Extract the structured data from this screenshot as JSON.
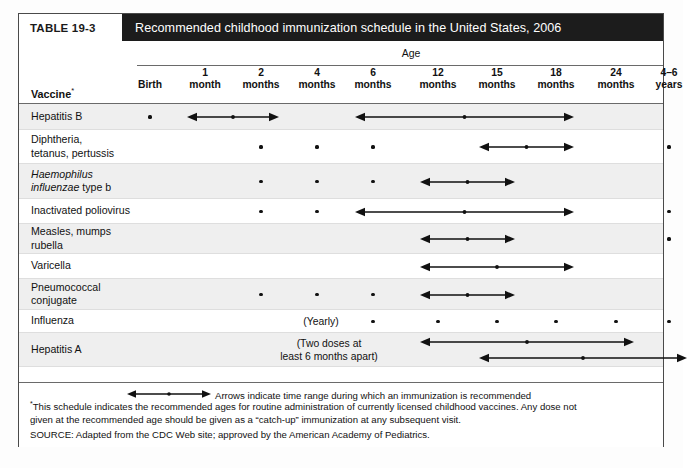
{
  "table": {
    "number": "TABLE 19-3",
    "title": "Recommended childhood immunization schedule in the United States, 2006",
    "group_header": "Age",
    "row_header": "Vaccine",
    "row_header_marker": "*"
  },
  "columns": [
    {
      "top": "",
      "bottom": "Birth",
      "x": 131
    },
    {
      "top": "1",
      "bottom": "month",
      "x": 186
    },
    {
      "top": "2",
      "bottom": "months",
      "x": 242
    },
    {
      "top": "4",
      "bottom": "months",
      "x": 298
    },
    {
      "top": "6",
      "bottom": "months",
      "x": 354
    },
    {
      "top": "12",
      "bottom": "months",
      "x": 419
    },
    {
      "top": "15",
      "bottom": "months",
      "x": 478
    },
    {
      "top": "18",
      "bottom": "months",
      "x": 537
    },
    {
      "top": "24",
      "bottom": "months",
      "x": 597
    },
    {
      "top": "4–6",
      "bottom": "years",
      "x": 650
    }
  ],
  "rows": [
    {
      "label": "Hepatitis B",
      "label_lines": [
        "Hepatitis B"
      ],
      "italic_lines": []
    },
    {
      "label": "Diphtheria, tetanus, pertussis",
      "label_lines": [
        "Diphtheria,",
        "tetanus, pertussis"
      ],
      "italic_lines": []
    },
    {
      "label": "Haemophilus influenzae type b",
      "label_lines": [
        "Haemophilus",
        "influenzae type b"
      ],
      "italic_lines": [
        0
      ]
    },
    {
      "label": "Inactivated poliovirus",
      "label_lines": [
        "Inactivated poliovirus"
      ],
      "italic_lines": []
    },
    {
      "label": "Measles, mumps rubella",
      "label_lines": [
        "Measles, mumps",
        "rubella"
      ],
      "italic_lines": []
    },
    {
      "label": "Varicella",
      "label_lines": [
        "Varicella"
      ],
      "italic_lines": []
    },
    {
      "label": "Pneumococcal conjugate",
      "label_lines": [
        "Pneumococcal",
        "conjugate"
      ],
      "italic_lines": []
    },
    {
      "label": "Influenza",
      "label_lines": [
        "Influenza"
      ],
      "italic_lines": [],
      "note": "(Yearly)"
    },
    {
      "label": "Hepatitis A",
      "label_lines": [
        "Hepatitis A"
      ],
      "italic_lines": [],
      "note": "(Two doses at\nleast 6 months apart)"
    }
  ],
  "schedule": {
    "Hepatitis B": {
      "dots": [
        "Birth"
      ],
      "ranges": [
        {
          "from": "1 month",
          "to": "2 months",
          "mid": true
        },
        {
          "from": "6 months",
          "to": "18 months",
          "mid": true
        }
      ]
    },
    "Diphtheria, tetanus, pertussis": {
      "dots": [
        "2 months",
        "4 months",
        "6 months",
        "4–6 years"
      ],
      "ranges": [
        {
          "from": "15 months",
          "to": "18 months",
          "mid": true
        }
      ]
    },
    "Haemophilus influenzae type b": {
      "dots": [
        "2 months",
        "4 months",
        "6 months"
      ],
      "ranges": [
        {
          "from": "12 months",
          "to": "15 months",
          "mid": true
        }
      ]
    },
    "Inactivated poliovirus": {
      "dots": [
        "2 months",
        "4 months",
        "4–6 years"
      ],
      "ranges": [
        {
          "from": "6 months",
          "to": "18 months",
          "mid": true
        }
      ]
    },
    "Measles, mumps rubella": {
      "dots": [
        "4–6 years"
      ],
      "ranges": [
        {
          "from": "12 months",
          "to": "15 months",
          "mid": true
        }
      ]
    },
    "Varicella": {
      "dots": [],
      "ranges": [
        {
          "from": "12 months",
          "to": "18 months",
          "mid": true
        }
      ]
    },
    "Pneumococcal conjugate": {
      "dots": [
        "2 months",
        "4 months",
        "6 months"
      ],
      "ranges": [
        {
          "from": "12 months",
          "to": "15 months",
          "mid": true
        }
      ]
    },
    "Influenza": {
      "dots": [
        "6 months",
        "12 months",
        "15 months",
        "18 months",
        "24 months",
        "4–6 years"
      ],
      "ranges": []
    },
    "Hepatitis A": {
      "dots": [],
      "ranges": [
        {
          "from": "12 months",
          "to": "24 months",
          "mid": true
        },
        {
          "from": "15 months",
          "to": "4–6 years",
          "mid": true
        }
      ]
    }
  },
  "legend": {
    "text": "Arrows indicate time range during which an immunization is recommended"
  },
  "footnotes": {
    "marker": "*",
    "line1": "This schedule indicates the recommended ages for routine administration of currently licensed childhood vaccines. Any dose not",
    "line2": "given at the recommended age should be given as a “catch-up” immunization at any subsequent visit.",
    "source": "SOURCE: Adapted from the CDC Web site; approved by the American Academy of Pediatrics."
  },
  "colors": {
    "title_bar": "#1c1c1c",
    "title_text": "#ffffff",
    "shaded_row": "#efefef",
    "ink": "#111111"
  }
}
